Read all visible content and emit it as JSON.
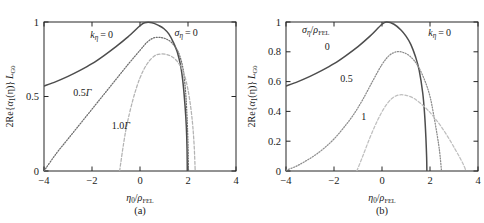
{
  "figure": {
    "panels": [
      {
        "id": "a",
        "caption": "(a)",
        "xlabel_parts": {
          "var": "η",
          "var_sub": "0",
          "slash": "/",
          "denom": "ρ",
          "denom_sub": "FEL"
        },
        "ylabel_parts": {
          "prefix": "2Re{",
          "alpha": "α",
          "alpha_sub": "1",
          "arg": "(η)}",
          "L": "L",
          "L_sub": "G0"
        },
        "annotations": [
          {
            "name": "k-eta-zero",
            "text": "kη = 0",
            "x": 0.3,
            "y": 0.895
          },
          {
            "name": "sigma-eta-zero",
            "text": "ση = 0",
            "x": 0.74,
            "y": 0.905
          },
          {
            "name": "curve-label-0p5gamma",
            "text": "0.5Γ",
            "x": 0.2,
            "y": 0.505
          },
          {
            "name": "curve-label-1p0gamma",
            "text": "1.0Γ",
            "x": 0.4,
            "y": 0.285
          }
        ],
        "xticks": [
          -4,
          -2,
          0,
          2,
          4
        ],
        "xticklabels": [
          "−4",
          "−2",
          "0",
          "2",
          "4"
        ],
        "yticks": [
          0,
          0.5,
          1
        ],
        "yticklabels": [
          "0",
          "0.5",
          "1"
        ],
        "xlim": [
          -4,
          4
        ],
        "ylim": [
          0,
          1
        ]
      },
      {
        "id": "b",
        "caption": "(b)",
        "xlabel_parts": {
          "var": "η",
          "var_sub": "0",
          "slash": "/",
          "denom": "ρ",
          "denom_sub": "FEL"
        },
        "ylabel_parts": {
          "prefix": "2Re{",
          "alpha": "α",
          "alpha_sub": "1",
          "arg": "(η)}",
          "L": "L",
          "L_sub": "G0"
        },
        "annotations": [
          {
            "name": "sigma-eta-over-rho",
            "text": "ση/ρFEL",
            "x": 0.155,
            "y": 0.925
          },
          {
            "name": "k-eta-zero",
            "text": "kη = 0",
            "x": 0.8,
            "y": 0.905
          },
          {
            "name": "curve-label-0",
            "text": "0",
            "x": 0.215,
            "y": 0.815
          },
          {
            "name": "curve-label-0p5",
            "text": "0.5",
            "x": 0.315,
            "y": 0.595
          },
          {
            "name": "curve-label-1",
            "text": "1",
            "x": 0.405,
            "y": 0.345
          }
        ],
        "xticks": [
          -4,
          -2,
          0,
          2,
          4
        ],
        "xticklabels": [
          "−4",
          "−2",
          "0",
          "2",
          "4"
        ],
        "yticks": [
          0,
          0.2,
          0.4,
          0.6,
          0.8,
          1
        ],
        "yticklabels": [
          "0",
          "0.2",
          "0.4",
          "0.6",
          "0.8",
          "1"
        ],
        "xlim": [
          -4,
          4
        ],
        "ylim": [
          0,
          1
        ]
      }
    ]
  },
  "chart_data": [
    {
      "type": "line",
      "panel": "a",
      "title": "",
      "xlabel": "eta_0 / rho_FEL",
      "ylabel": "2Re{alpha_1(eta)} L_G0",
      "xlim": [
        -4,
        4
      ],
      "ylim": [
        0,
        1
      ],
      "grid": false,
      "legend_position": "inline-annotations",
      "series": [
        {
          "name": "0Γ",
          "style": "solid",
          "color": "#4d4d4d",
          "x": [
            -4,
            -3.5,
            -3,
            -2.5,
            -2,
            -1.5,
            -1,
            -0.5,
            0,
            0.2,
            0.5,
            0.8,
            1,
            1.2,
            1.4,
            1.55,
            1.7,
            1.8,
            1.88,
            1.93,
            1.96,
            1.97
          ],
          "y": [
            0.57,
            0.6,
            0.635,
            0.675,
            0.72,
            0.775,
            0.835,
            0.9,
            0.975,
            0.995,
            0.995,
            0.975,
            0.955,
            0.92,
            0.86,
            0.8,
            0.7,
            0.58,
            0.43,
            0.3,
            0.15,
            0.0
          ]
        },
        {
          "name": "0.5Γ",
          "style": "dotted",
          "color": "#6e6e6e",
          "x": [
            -4,
            -3.5,
            -3,
            -2.5,
            -2,
            -1.5,
            -1,
            -0.5,
            0,
            0.3,
            0.6,
            0.9,
            1.1,
            1.3,
            1.5,
            1.65,
            1.8,
            1.9,
            1.96,
            2.0,
            2.02
          ],
          "y": [
            0.0,
            0.115,
            0.215,
            0.315,
            0.415,
            0.515,
            0.615,
            0.715,
            0.81,
            0.865,
            0.895,
            0.895,
            0.885,
            0.865,
            0.825,
            0.775,
            0.68,
            0.53,
            0.36,
            0.18,
            0.0
          ]
        },
        {
          "name": "1.0Γ",
          "style": "dashed",
          "color": "#b3b3b3",
          "x": [
            -0.85,
            -0.6,
            -0.3,
            0,
            0.3,
            0.6,
            0.85,
            1.1,
            1.3,
            1.5,
            1.7,
            1.85,
            2.0,
            2.12,
            2.2,
            2.26,
            2.3
          ],
          "y": [
            0.0,
            0.265,
            0.475,
            0.625,
            0.72,
            0.772,
            0.785,
            0.782,
            0.77,
            0.745,
            0.7,
            0.645,
            0.545,
            0.42,
            0.3,
            0.16,
            0.0
          ]
        }
      ]
    },
    {
      "type": "line",
      "panel": "b",
      "title": "",
      "xlabel": "eta_0 / rho_FEL",
      "ylabel": "2Re{alpha_1(eta)} L_G0",
      "xlim": [
        -4,
        4
      ],
      "ylim": [
        0,
        1
      ],
      "grid": false,
      "legend_position": "inline-annotations",
      "series": [
        {
          "name": "0",
          "style": "solid",
          "color": "#4d4d4d",
          "x": [
            -4,
            -3.5,
            -3,
            -2.5,
            -2,
            -1.5,
            -1,
            -0.5,
            0,
            0.2,
            0.5,
            0.8,
            1,
            1.2,
            1.4,
            1.55,
            1.7,
            1.78,
            1.83,
            1.86,
            1.87
          ],
          "y": [
            0.57,
            0.6,
            0.635,
            0.675,
            0.72,
            0.775,
            0.835,
            0.905,
            0.985,
            1.0,
            0.985,
            0.945,
            0.905,
            0.85,
            0.765,
            0.675,
            0.52,
            0.37,
            0.22,
            0.09,
            0.0
          ]
        },
        {
          "name": "0.5",
          "style": "dotted",
          "color": "#8c8c8c",
          "x": [
            -4,
            -3.6,
            -3.2,
            -2.8,
            -2.4,
            -2,
            -1.6,
            -1.2,
            -0.8,
            -0.4,
            0,
            0.3,
            0.6,
            0.9,
            1.2,
            1.5,
            1.8,
            2.0,
            2.15,
            2.3,
            2.4,
            2.48
          ],
          "y": [
            0.005,
            0.03,
            0.065,
            0.105,
            0.155,
            0.215,
            0.29,
            0.375,
            0.48,
            0.6,
            0.715,
            0.775,
            0.8,
            0.795,
            0.765,
            0.705,
            0.6,
            0.5,
            0.38,
            0.24,
            0.13,
            0.0
          ]
        },
        {
          "name": "1",
          "style": "dashed",
          "color": "#bfbfbf",
          "x": [
            -1.05,
            -0.8,
            -0.5,
            -0.2,
            0.1,
            0.4,
            0.7,
            1,
            1.3,
            1.6,
            1.9,
            2.2,
            2.5,
            2.8,
            3.05,
            3.25,
            3.4,
            3.5
          ],
          "y": [
            0.0,
            0.1,
            0.225,
            0.335,
            0.425,
            0.485,
            0.51,
            0.508,
            0.49,
            0.455,
            0.41,
            0.355,
            0.29,
            0.215,
            0.145,
            0.088,
            0.04,
            0.0
          ]
        }
      ]
    }
  ]
}
